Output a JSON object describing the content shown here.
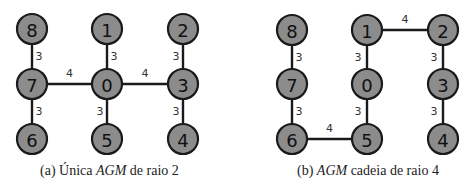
{
  "figures": [
    {
      "id": "a",
      "caption": {
        "prefix": "(a) Única ",
        "em": "AGM",
        "suffix": " de raio 2"
      },
      "caption_x": 40,
      "nodes": [
        {
          "id": "8",
          "x": 32,
          "y": 29
        },
        {
          "id": "1",
          "x": 107,
          "y": 29
        },
        {
          "id": "2",
          "x": 183,
          "y": 29
        },
        {
          "id": "7",
          "x": 32,
          "y": 84
        },
        {
          "id": "0",
          "x": 107,
          "y": 84
        },
        {
          "id": "3",
          "x": 183,
          "y": 84
        },
        {
          "id": "6",
          "x": 32,
          "y": 139
        },
        {
          "id": "5",
          "x": 107,
          "y": 139
        },
        {
          "id": "4",
          "x": 183,
          "y": 139
        }
      ],
      "edges": [
        {
          "from": "8",
          "to": "7",
          "weight": "3"
        },
        {
          "from": "1",
          "to": "0",
          "weight": "3"
        },
        {
          "from": "2",
          "to": "3",
          "weight": "3"
        },
        {
          "from": "7",
          "to": "0",
          "weight": "4"
        },
        {
          "from": "0",
          "to": "3",
          "weight": "4"
        },
        {
          "from": "7",
          "to": "6",
          "weight": "3"
        },
        {
          "from": "0",
          "to": "5",
          "weight": "3"
        },
        {
          "from": "3",
          "to": "4",
          "weight": "3"
        }
      ]
    },
    {
      "id": "b",
      "caption": {
        "prefix": "(b) ",
        "em": "AGM",
        "suffix": " cadeia de raio 4"
      },
      "caption_x": 297,
      "nodes": [
        {
          "id": "8",
          "x": 292,
          "y": 30
        },
        {
          "id": "1",
          "x": 367,
          "y": 30
        },
        {
          "id": "2",
          "x": 443,
          "y": 30
        },
        {
          "id": "7",
          "x": 292,
          "y": 84
        },
        {
          "id": "0",
          "x": 367,
          "y": 84
        },
        {
          "id": "3",
          "x": 443,
          "y": 84
        },
        {
          "id": "6",
          "x": 292,
          "y": 139
        },
        {
          "id": "5",
          "x": 367,
          "y": 139
        },
        {
          "id": "4",
          "x": 443,
          "y": 139
        }
      ],
      "edges": [
        {
          "from": "8",
          "to": "7",
          "weight": "3"
        },
        {
          "from": "1",
          "to": "2",
          "weight": "4"
        },
        {
          "from": "1",
          "to": "0",
          "weight": "3"
        },
        {
          "from": "2",
          "to": "3",
          "weight": "3"
        },
        {
          "from": "7",
          "to": "6",
          "weight": "3"
        },
        {
          "from": "0",
          "to": "5",
          "weight": "3"
        },
        {
          "from": "3",
          "to": "4",
          "weight": "3"
        },
        {
          "from": "6",
          "to": "5",
          "weight": "4"
        }
      ]
    }
  ],
  "style": {
    "node_fill": "#8c8c8c",
    "stroke": "#1a1a1a",
    "node_radius": 15
  }
}
